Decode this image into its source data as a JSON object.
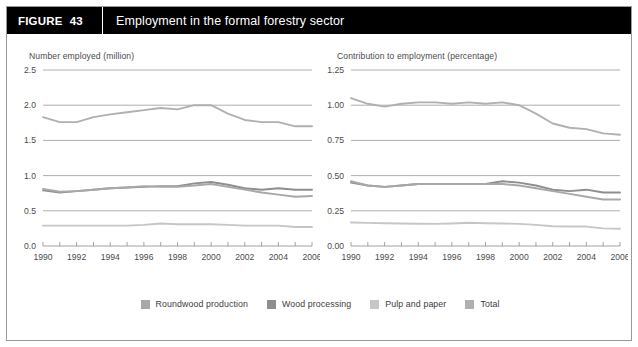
{
  "figure": {
    "number_label": "FIGURE",
    "number": "43",
    "title": "Employment in the formal forestry sector"
  },
  "colors": {
    "roundwood": "#a8a8a8",
    "wood_processing": "#8e8e8e",
    "pulp_paper": "#c6c6c6",
    "total": "#b0b0b0",
    "grid": "#8c8c8c",
    "header_bg": "#000000",
    "header_text": "#ffffff",
    "axis_text": "#4a4a4a"
  },
  "legend": {
    "items": [
      {
        "label": "Roundwood production",
        "color": "#a8a8a8",
        "key": "roundwood"
      },
      {
        "label": "Wood processing",
        "color": "#8e8e8e",
        "key": "wood_processing"
      },
      {
        "label": "Pulp and paper",
        "color": "#c6c6c6",
        "key": "pulp_paper"
      },
      {
        "label": "Total",
        "color": "#b0b0b0",
        "key": "total"
      }
    ]
  },
  "chart_data": [
    {
      "id": "employment-count",
      "type": "line",
      "title": "Number employed (million)",
      "xlabel": "",
      "ylabel": "Number employed (million)",
      "ylim": [
        0.0,
        2.5
      ],
      "xlim": [
        1990,
        2006
      ],
      "grid": true,
      "legend_position": "bottom-shared",
      "yticks": [
        "0.0",
        "0.5",
        "1.0",
        "1.5",
        "2.0",
        "2.5"
      ],
      "ytick_values": [
        0.0,
        0.5,
        1.0,
        1.5,
        2.0,
        2.5
      ],
      "x": [
        1990,
        1991,
        1992,
        1993,
        1994,
        1995,
        1996,
        1997,
        1998,
        1999,
        2000,
        2001,
        2002,
        2003,
        2004,
        2005,
        2006
      ],
      "xtick_labels": [
        "1990",
        "",
        "1992",
        "",
        "1994",
        "",
        "1996",
        "",
        "1998",
        "",
        "2000",
        "",
        "2002",
        "",
        "2004",
        "",
        "2006"
      ],
      "series": [
        {
          "name": "Total",
          "color": "#b0b0b0",
          "values": [
            1.83,
            1.76,
            1.76,
            1.83,
            1.87,
            1.9,
            1.93,
            1.96,
            1.94,
            2.0,
            2.0,
            1.88,
            1.79,
            1.76,
            1.76,
            1.7,
            1.7
          ]
        },
        {
          "name": "Wood processing",
          "color": "#8e8e8e",
          "values": [
            0.79,
            0.76,
            0.78,
            0.8,
            0.82,
            0.83,
            0.84,
            0.85,
            0.85,
            0.89,
            0.91,
            0.87,
            0.82,
            0.8,
            0.82,
            0.8,
            0.8
          ]
        },
        {
          "name": "Roundwood production",
          "color": "#a8a8a8",
          "values": [
            0.81,
            0.77,
            0.78,
            0.8,
            0.82,
            0.83,
            0.85,
            0.84,
            0.84,
            0.86,
            0.88,
            0.84,
            0.8,
            0.76,
            0.73,
            0.7,
            0.71
          ]
        },
        {
          "name": "Pulp and paper",
          "color": "#c6c6c6",
          "values": [
            0.29,
            0.29,
            0.29,
            0.29,
            0.29,
            0.29,
            0.3,
            0.32,
            0.31,
            0.31,
            0.31,
            0.3,
            0.29,
            0.29,
            0.29,
            0.27,
            0.27
          ]
        }
      ]
    },
    {
      "id": "employment-share",
      "type": "line",
      "title": "Contribution to employment (percentage)",
      "xlabel": "",
      "ylabel": "Contribution to employment (percentage)",
      "ylim": [
        0.0,
        1.25
      ],
      "xlim": [
        1990,
        2006
      ],
      "grid": true,
      "legend_position": "bottom-shared",
      "yticks": [
        "0.00",
        "0.25",
        "0.50",
        "0.75",
        "1.00",
        "1.25"
      ],
      "ytick_values": [
        0.0,
        0.25,
        0.5,
        0.75,
        1.0,
        1.25
      ],
      "x": [
        1990,
        1991,
        1992,
        1993,
        1994,
        1995,
        1996,
        1997,
        1998,
        1999,
        2000,
        2001,
        2002,
        2003,
        2004,
        2005,
        2006
      ],
      "xtick_labels": [
        "1990",
        "",
        "1992",
        "",
        "1994",
        "",
        "1996",
        "",
        "1998",
        "",
        "2000",
        "",
        "2002",
        "",
        "2004",
        "",
        "2006"
      ],
      "series": [
        {
          "name": "Total",
          "color": "#b0b0b0",
          "values": [
            1.05,
            1.01,
            0.99,
            1.01,
            1.02,
            1.02,
            1.01,
            1.02,
            1.01,
            1.02,
            1.0,
            0.94,
            0.87,
            0.84,
            0.83,
            0.8,
            0.79
          ]
        },
        {
          "name": "Wood processing",
          "color": "#8e8e8e",
          "values": [
            0.45,
            0.43,
            0.42,
            0.43,
            0.44,
            0.44,
            0.44,
            0.44,
            0.44,
            0.46,
            0.45,
            0.43,
            0.4,
            0.39,
            0.4,
            0.38,
            0.38
          ]
        },
        {
          "name": "Roundwood production",
          "color": "#a8a8a8",
          "values": [
            0.46,
            0.43,
            0.42,
            0.43,
            0.44,
            0.44,
            0.44,
            0.44,
            0.44,
            0.44,
            0.43,
            0.41,
            0.39,
            0.37,
            0.35,
            0.33,
            0.33
          ]
        },
        {
          "name": "Pulp and paper",
          "color": "#c6c6c6",
          "values": [
            0.167,
            0.164,
            0.162,
            0.16,
            0.158,
            0.157,
            0.16,
            0.165,
            0.162,
            0.16,
            0.157,
            0.15,
            0.14,
            0.138,
            0.138,
            0.125,
            0.122
          ]
        }
      ]
    }
  ]
}
